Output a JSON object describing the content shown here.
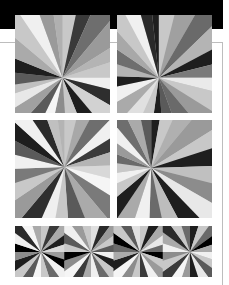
{
  "page": {
    "background": "#ffffff",
    "top_bar_color": "#000000",
    "rule_color": "#bdbdbd"
  },
  "figures": [
    {
      "id": "p-tl",
      "label": "sunburst-top-left",
      "center": [
        0.5,
        0.49
      ],
      "wedges": [
        [
          0,
          "#c8c8c8"
        ],
        [
          12,
          "#3a3a3a"
        ],
        [
          24,
          "#6e6e6e"
        ],
        [
          40,
          "#9a9a9a"
        ],
        [
          58,
          "#b4b4b4"
        ],
        [
          72,
          "#c8c8c8"
        ],
        [
          90,
          "#f0f0f0"
        ],
        [
          104,
          "#2e2e2e"
        ],
        [
          120,
          "#d2d2d2"
        ],
        [
          140,
          "#1e1e1e"
        ],
        [
          158,
          "#c8c8c8"
        ],
        [
          176,
          "#8c8c8c"
        ],
        [
          192,
          "#f5f5f5"
        ],
        [
          206,
          "#5a5a5a"
        ],
        [
          222,
          "#a0a0a0"
        ],
        [
          238,
          "#e8e8e8"
        ],
        [
          252,
          "#c0c0c0"
        ],
        [
          262,
          "#5a5a5a"
        ],
        [
          276,
          "#1e1e1e"
        ],
        [
          292,
          "#aaaaaa"
        ],
        [
          310,
          "#c8c8c8"
        ],
        [
          326,
          "#f0f0f0"
        ],
        [
          340,
          "#9a9a9a"
        ],
        [
          352,
          "#b0b0b0"
        ]
      ]
    },
    {
      "id": "p-tr",
      "label": "sunburst-top-right",
      "center": [
        0.44,
        0.49
      ],
      "wedges": [
        [
          0,
          "#c8c8c8"
        ],
        [
          14,
          "#a0a0a0"
        ],
        [
          30,
          "#6a6a6a"
        ],
        [
          46,
          "#b4b4b4"
        ],
        [
          62,
          "#1e1e1e"
        ],
        [
          76,
          "#7a7a7a"
        ],
        [
          90,
          "#eaeaea"
        ],
        [
          104,
          "#c8c8c8"
        ],
        [
          122,
          "#9a9a9a"
        ],
        [
          140,
          "#6a6a6a"
        ],
        [
          160,
          "#5a5a5a"
        ],
        [
          176,
          "#1e1e1e"
        ],
        [
          188,
          "#c8c8c8"
        ],
        [
          204,
          "#e0e0e0"
        ],
        [
          222,
          "#aaaaaa"
        ],
        [
          240,
          "#f0f0f0"
        ],
        [
          258,
          "#1e1e1e"
        ],
        [
          272,
          "#b4b4b4"
        ],
        [
          288,
          "#6e6e6e"
        ],
        [
          304,
          "#a8a8a8"
        ],
        [
          318,
          "#c8c8c8"
        ],
        [
          332,
          "#f0f0f0"
        ],
        [
          344,
          "#2a2a2a"
        ],
        [
          354,
          "#1e1e1e"
        ]
      ]
    },
    {
      "id": "p-ml",
      "label": "sunburst-middle-left",
      "center": [
        0.52,
        0.33
      ],
      "wedges": [
        [
          0,
          "#c8c8c8"
        ],
        [
          14,
          "#a8a8a8"
        ],
        [
          28,
          "#6e6e6e"
        ],
        [
          44,
          "#f0f0f0"
        ],
        [
          58,
          "#3a3a3a"
        ],
        [
          72,
          "#b4b4b4"
        ],
        [
          88,
          "#d8d8d8"
        ],
        [
          104,
          "#f5f5f5"
        ],
        [
          122,
          "#7a7a7a"
        ],
        [
          140,
          "#aaaaaa"
        ],
        [
          158,
          "#5a5a5a"
        ],
        [
          176,
          "#c8c8c8"
        ],
        [
          190,
          "#f0f0f0"
        ],
        [
          204,
          "#2e2e2e"
        ],
        [
          220,
          "#9a9a9a"
        ],
        [
          236,
          "#c8c8c8"
        ],
        [
          252,
          "#7a7a7a"
        ],
        [
          268,
          "#f0f0f0"
        ],
        [
          284,
          "#5a5a5a"
        ],
        [
          298,
          "#1e1e1e"
        ],
        [
          312,
          "#f0f0f0"
        ],
        [
          326,
          "#2a2a2a"
        ],
        [
          340,
          "#c0c0c0"
        ],
        [
          352,
          "#b4b4b4"
        ]
      ]
    },
    {
      "id": "p-mr",
      "label": "sunburst-middle-right",
      "center": [
        0.36,
        0.34
      ],
      "wedges": [
        [
          0,
          "#1e1e1e"
        ],
        [
          10,
          "#c8c8c8"
        ],
        [
          24,
          "#b0b0b0"
        ],
        [
          40,
          "#9a9a9a"
        ],
        [
          58,
          "#c8c8c8"
        ],
        [
          72,
          "#1e1e1e"
        ],
        [
          88,
          "#c0c0c0"
        ],
        [
          104,
          "#8c8c8c"
        ],
        [
          120,
          "#e8e8e8"
        ],
        [
          136,
          "#1e1e1e"
        ],
        [
          152,
          "#bdbdbd"
        ],
        [
          168,
          "#6a6a6a"
        ],
        [
          182,
          "#f0f0f0"
        ],
        [
          198,
          "#aaaaaa"
        ],
        [
          214,
          "#1e1e1e"
        ],
        [
          230,
          "#c8c8c8"
        ],
        [
          246,
          "#f0f0f0"
        ],
        [
          262,
          "#c8c8c8"
        ],
        [
          278,
          "#6a6a6a"
        ],
        [
          292,
          "#9a9a9a"
        ],
        [
          306,
          "#f0f0f0"
        ],
        [
          320,
          "#6e6e6e"
        ],
        [
          334,
          "#aaaaaa"
        ],
        [
          348,
          "#5a5a5a"
        ]
      ]
    }
  ],
  "bottom_strip": {
    "id": "p-bot",
    "label": "sunburst-strip",
    "tiles": [
      {
        "center": [
          26,
          26
        ],
        "wedges": [
          [
            0,
            "#c8c8c8"
          ],
          [
            18,
            "#3a3a3a"
          ],
          [
            36,
            "#aaaaaa"
          ],
          [
            54,
            "#1e1e1e"
          ],
          [
            72,
            "#d8d8d8"
          ],
          [
            90,
            "#9a9a9a"
          ],
          [
            108,
            "#000000"
          ],
          [
            126,
            "#f0f0f0"
          ],
          [
            144,
            "#6a6a6a"
          ],
          [
            162,
            "#c8c8c8"
          ],
          [
            180,
            "#f5f5f5"
          ],
          [
            198,
            "#5a5a5a"
          ],
          [
            216,
            "#c8c8c8"
          ],
          [
            234,
            "#1e1e1e"
          ],
          [
            252,
            "#8c8c8c"
          ],
          [
            270,
            "#000000"
          ],
          [
            288,
            "#f0f0f0"
          ],
          [
            306,
            "#2a2a2a"
          ],
          [
            324,
            "#f5f5f5"
          ],
          [
            342,
            "#aaaaaa"
          ]
        ]
      },
      {
        "center": [
          76,
          26
        ],
        "wedges": [
          [
            0,
            "#e0e0e0"
          ],
          [
            18,
            "#2a2a2a"
          ],
          [
            36,
            "#9a9a9a"
          ],
          [
            54,
            "#c8c8c8"
          ],
          [
            72,
            "#5a5a5a"
          ],
          [
            90,
            "#f0f0f0"
          ],
          [
            108,
            "#1e1e1e"
          ],
          [
            126,
            "#c8c8c8"
          ],
          [
            144,
            "#6a6a6a"
          ],
          [
            162,
            "#f0f0f0"
          ],
          [
            180,
            "#aaaaaa"
          ],
          [
            198,
            "#3a3a3a"
          ],
          [
            216,
            "#f5f5f5"
          ],
          [
            234,
            "#8c8c8c"
          ],
          [
            252,
            "#000000"
          ],
          [
            270,
            "#c8c8c8"
          ],
          [
            288,
            "#5a5a5a"
          ],
          [
            306,
            "#f0f0f0"
          ],
          [
            324,
            "#9a9a9a"
          ],
          [
            342,
            "#c8c8c8"
          ]
        ]
      },
      {
        "center": [
          125,
          26
        ],
        "wedges": [
          [
            0,
            "#c8c8c8"
          ],
          [
            18,
            "#1e1e1e"
          ],
          [
            36,
            "#aaaaaa"
          ],
          [
            54,
            "#e8e8e8"
          ],
          [
            72,
            "#6a6a6a"
          ],
          [
            90,
            "#000000"
          ],
          [
            108,
            "#c8c8c8"
          ],
          [
            126,
            "#9a9a9a"
          ],
          [
            144,
            "#f0f0f0"
          ],
          [
            162,
            "#3a3a3a"
          ],
          [
            180,
            "#c8c8c8"
          ],
          [
            198,
            "#8c8c8c"
          ],
          [
            216,
            "#f5f5f5"
          ],
          [
            234,
            "#1e1e1e"
          ],
          [
            252,
            "#aaaaaa"
          ],
          [
            270,
            "#6a6a6a"
          ],
          [
            288,
            "#000000"
          ],
          [
            306,
            "#c8c8c8"
          ],
          [
            324,
            "#5a5a5a"
          ],
          [
            342,
            "#e0e0e0"
          ]
        ]
      },
      {
        "center": [
          175,
          26
        ],
        "wedges": [
          [
            0,
            "#1e1e1e"
          ],
          [
            18,
            "#c8c8c8"
          ],
          [
            36,
            "#6a6a6a"
          ],
          [
            54,
            "#000000"
          ],
          [
            72,
            "#aaaaaa"
          ],
          [
            90,
            "#f0f0f0"
          ],
          [
            108,
            "#c8c8c8"
          ],
          [
            126,
            "#5a5a5a"
          ],
          [
            144,
            "#e8e8e8"
          ],
          [
            162,
            "#1e1e1e"
          ],
          [
            180,
            "#9a9a9a"
          ],
          [
            198,
            "#f5f5f5"
          ],
          [
            216,
            "#3a3a3a"
          ],
          [
            234,
            "#c8c8c8"
          ],
          [
            252,
            "#8c8c8c"
          ],
          [
            270,
            "#f0f0f0"
          ],
          [
            288,
            "#aaaaaa"
          ],
          [
            306,
            "#2a2a2a"
          ],
          [
            324,
            "#c8c8c8"
          ],
          [
            342,
            "#6a6a6a"
          ]
        ]
      }
    ]
  }
}
